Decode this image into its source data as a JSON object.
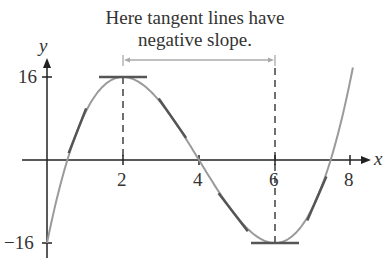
{
  "chart_data": {
    "type": "line",
    "title": "",
    "annotation": {
      "line1": "Here tangent lines have",
      "line2": "negative slope.",
      "interval": [
        2,
        6
      ]
    },
    "xlabel": "x",
    "ylabel": "y",
    "x_ticks": [
      "2",
      "4",
      "6",
      "8"
    ],
    "y_ticks": [
      "16",
      "−16"
    ],
    "xlim": [
      0,
      8.3
    ],
    "ylim": [
      -16,
      16
    ],
    "function": "f(x) = x^3 - 12x^2 + 36x - 16",
    "series": [
      {
        "name": "f(x)",
        "x": [
          0,
          0.5,
          1,
          1.5,
          2,
          2.5,
          3,
          3.5,
          4,
          4.5,
          5,
          5.5,
          6,
          6.5,
          7,
          7.5,
          8
        ],
        "values": [
          -16,
          -0.875,
          9,
          14.375,
          16,
          14.625,
          11,
          5.875,
          0,
          -5.875,
          -11,
          -14.625,
          -16,
          -14.375,
          -9,
          -0.875,
          16
        ]
      }
    ],
    "tangent_points_x": [
      0.8,
      2,
      3.3,
      4.9,
      6,
      7.1
    ],
    "critical_points": [
      {
        "x": 2,
        "y": 16,
        "label": "local max"
      },
      {
        "x": 6,
        "y": -16,
        "label": "local min"
      }
    ],
    "grid": false,
    "colors": {
      "curve": "#9a9a9a",
      "tangent": "#555555",
      "axis": "#222222",
      "bracket": "#aaaaaa"
    }
  }
}
